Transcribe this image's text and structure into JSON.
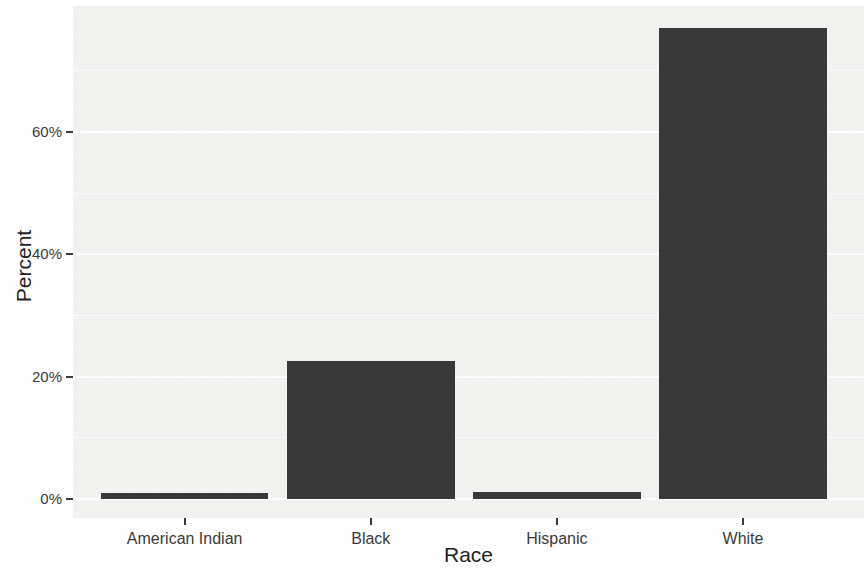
{
  "figure": {
    "background": "#ffffff"
  },
  "chart_data": {
    "type": "bar",
    "title": "",
    "categories": [
      "American Indian",
      "Black",
      "Hispanic",
      "White"
    ],
    "values": [
      1,
      22.5,
      1.2,
      77
    ],
    "xlabel": "Race",
    "ylabel": "Percent",
    "y_ticks": [
      {
        "value": 0,
        "label": "0%"
      },
      {
        "value": 20,
        "label": "20%"
      },
      {
        "value": 40,
        "label": "40%"
      },
      {
        "value": 60,
        "label": "60%"
      }
    ],
    "y_minor_ticks": [
      10,
      30,
      50,
      70
    ],
    "ylim": [
      -3.1,
      80.6
    ],
    "xlim": [
      0.4,
      4.65
    ],
    "bar_width": 0.9,
    "grid": "horizontal major and minor, white on gray panel",
    "legend": "none",
    "colors": {
      "bar": "#383838",
      "panel_background": "#f2f2f1",
      "grid_major": "#ffffff",
      "grid_minor": "#fafafa",
      "axis_text": "#3a3a3a",
      "axis_title": "#1f1f1f",
      "tick_mark": "#3a3a3a"
    }
  }
}
